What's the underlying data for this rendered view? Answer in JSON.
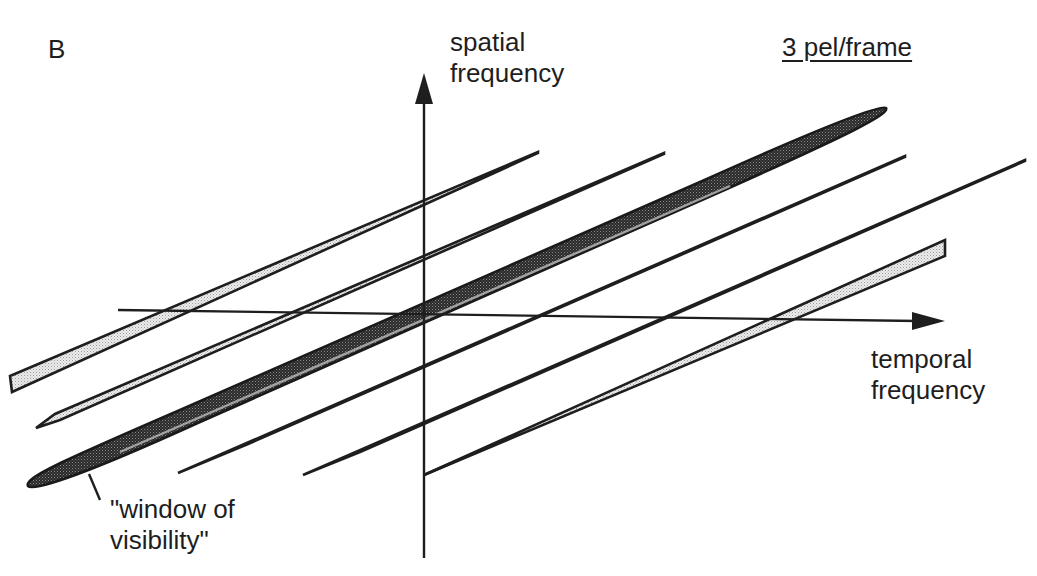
{
  "figure": {
    "panel_label": "B",
    "y_axis_label_line1": "spatial",
    "y_axis_label_line2": "frequency",
    "x_axis_label_line1": "temporal",
    "x_axis_label_line2": "frequency",
    "speed_label": "3 pel/frame",
    "window_label_line1": "\"window of",
    "window_label_line2": "visibility\""
  },
  "colors": {
    "ink": "#1e1e1e",
    "stipple_light": "#d6d6d6",
    "stipple_dark": "#3a3a3a",
    "background": "#ffffff"
  },
  "diagram": {
    "type": "spatiotemporal frequency spectrum",
    "axes": {
      "vertical": "spatial frequency",
      "horizontal": "temporal frequency"
    },
    "elements": [
      {
        "kind": "window-of-visibility",
        "shape": "dark stippled ellipse"
      },
      {
        "kind": "spectral-replica",
        "count": 6,
        "shape": "thin stippled bands parallel to the window"
      }
    ]
  }
}
